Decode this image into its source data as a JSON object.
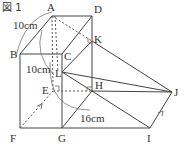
{
  "figure": {
    "title": "図 1",
    "colors": {
      "line": "#444444",
      "dashed": "#555555",
      "arc": "#777777",
      "text": "#333333"
    },
    "points": {
      "A": {
        "label": "A",
        "x": 52,
        "y": 16
      },
      "D": {
        "label": "D",
        "x": 92,
        "y": 16
      },
      "B": {
        "label": "B",
        "x": 20,
        "y": 54
      },
      "C": {
        "label": "C",
        "x": 62,
        "y": 54
      },
      "E": {
        "label": "E",
        "x": 53,
        "y": 91
      },
      "H": {
        "label": "H",
        "x": 92,
        "y": 91
      },
      "F": {
        "label": "F",
        "x": 20,
        "y": 128
      },
      "G": {
        "label": "G",
        "x": 62,
        "y": 128
      },
      "K": {
        "label": "K",
        "x": 92,
        "y": 41
      },
      "L": {
        "label": "L",
        "x": 62,
        "y": 72
      },
      "I": {
        "label": "I",
        "x": 150,
        "y": 128
      },
      "J": {
        "label": "J",
        "x": 172,
        "y": 92
      }
    },
    "measurements": {
      "ab": "10cm",
      "al": "10cm",
      "gi": "16cm"
    }
  }
}
